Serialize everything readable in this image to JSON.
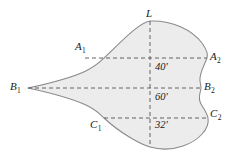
{
  "figure": {
    "fill_color": "#ececec",
    "outline_color": "#8a8a8a",
    "dash_color": "#555555",
    "label_color": "#1a1a1a",
    "background": "#ffffff",
    "axis_label": "L",
    "points": [
      {
        "id": "A1",
        "base": "A",
        "sub": "1",
        "x": 82,
        "y": 47
      },
      {
        "id": "A2",
        "base": "A",
        "sub": "2",
        "x": 210,
        "y": 56
      },
      {
        "id": "B1",
        "base": "B",
        "sub": "1",
        "x": 10,
        "y": 86
      },
      {
        "id": "B2",
        "base": "B",
        "sub": "2",
        "x": 203,
        "y": 86
      },
      {
        "id": "C1",
        "base": "C",
        "sub": "1",
        "x": 90,
        "y": 123
      },
      {
        "id": "C2",
        "base": "C",
        "sub": "2",
        "x": 210,
        "y": 113
      }
    ],
    "dimensions": [
      {
        "id": "d-A-B",
        "value": "40'",
        "x": 155,
        "y": 62
      },
      {
        "id": "d-B-C",
        "value": "60'",
        "x": 155,
        "y": 92
      },
      {
        "id": "d-C-bottom",
        "value": "32'",
        "x": 155,
        "y": 120
      }
    ],
    "offset_lines": [
      {
        "id": "line-A",
        "y": 58,
        "x1": 85,
        "x2": 207
      },
      {
        "id": "line-B",
        "y": 88,
        "x1": 28,
        "x2": 201
      },
      {
        "id": "line-C",
        "y": 118,
        "x1": 104,
        "x2": 208
      }
    ],
    "center_line": {
      "id": "line-L",
      "x": 150,
      "y1": 21,
      "y2": 147
    }
  }
}
